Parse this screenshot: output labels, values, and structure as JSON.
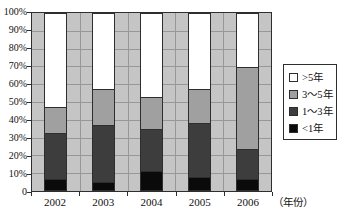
{
  "chart_data": {
    "type": "bar",
    "stacked": true,
    "unit": "percent_of_total",
    "categories": [
      "2002",
      "2003",
      "2004",
      "2005",
      "2006"
    ],
    "series": [
      {
        "name": "<1年",
        "color": "#0a0a0a",
        "values": [
          6,
          4.5,
          11,
          7.5,
          6
        ]
      },
      {
        "name": "1～3年",
        "color": "#3d3d3d",
        "values": [
          26.5,
          32.5,
          23.5,
          30.5,
          17.5
        ]
      },
      {
        "name": "3～5年",
        "color": "#a0a0a0",
        "values": [
          14.5,
          20.5,
          18.5,
          19.5,
          46.5
        ]
      },
      {
        "name": ">5年",
        "color": "#ffffff",
        "values": [
          53,
          42.5,
          47,
          42.5,
          30
        ]
      }
    ],
    "y_axis": {
      "range": [
        0,
        100
      ],
      "ticks": [
        {
          "value": 100,
          "label": "100%"
        },
        {
          "value": 90,
          "label": "90%"
        },
        {
          "value": 80,
          "label": "80%"
        },
        {
          "value": 70,
          "label": "70%"
        },
        {
          "value": 60,
          "label": "60%"
        },
        {
          "value": 50,
          "label": "50%"
        },
        {
          "value": 40,
          "label": "40%"
        },
        {
          "value": 30,
          "label": "30%"
        },
        {
          "value": 20,
          "label": "20%"
        },
        {
          "value": 10,
          "label": "10%"
        },
        {
          "value": 0,
          "label": "0"
        }
      ]
    },
    "x_axis": {
      "unit_label": "（年份）"
    },
    "legend": {
      "position": "right",
      "items_top_to_bottom": [
        ">5年",
        "3～5年",
        "1～3年",
        "<1年"
      ]
    },
    "grid": {
      "horizontal": true,
      "vertical_category_boundaries": true
    },
    "colors": {
      "page_background": "#ffffff",
      "plot_background": "#c5c5c5",
      "gridline": "#989898",
      "axis": "#2e2e2e",
      "bar_border": "#2e2e2e",
      "text": "#111111",
      "legend_background": "#ffffff",
      "legend_border": "#2e2e2e"
    }
  }
}
